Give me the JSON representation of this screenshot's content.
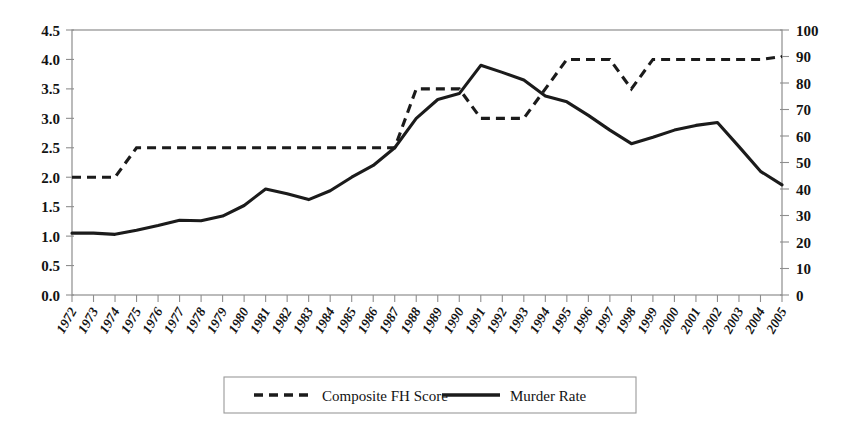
{
  "chart_data": {
    "type": "line",
    "title": "",
    "subtitle": "",
    "xlabel": "",
    "ylabel": "",
    "y2label": "",
    "grid": false,
    "legend_position": "bottom",
    "categories": [
      "1972",
      "1973",
      "1974",
      "1975",
      "1976",
      "1977",
      "1978",
      "1979",
      "1980",
      "1981",
      "1982",
      "1983",
      "1984",
      "1985",
      "1986",
      "1987",
      "1988",
      "1989",
      "1990",
      "1991",
      "1992",
      "1993",
      "1994",
      "1995",
      "1996",
      "1997",
      "1998",
      "1999",
      "2000",
      "2001",
      "2002",
      "2003",
      "2004",
      "2005"
    ],
    "ylim": [
      0,
      4.5
    ],
    "ytick_labels": [
      "0.0",
      "0.5",
      "1.0",
      "1.5",
      "2.0",
      "2.5",
      "3.0",
      "3.5",
      "4.0",
      "4.5"
    ],
    "ytick_values": [
      0,
      0.5,
      1.0,
      1.5,
      2.0,
      2.5,
      3.0,
      3.5,
      4.0,
      4.5
    ],
    "y2lim": [
      0,
      100
    ],
    "y2tick_labels": [
      "0",
      "10",
      "20",
      "30",
      "40",
      "50",
      "60",
      "70",
      "80",
      "90",
      "100"
    ],
    "y2tick_values": [
      0,
      10,
      20,
      30,
      40,
      50,
      60,
      70,
      80,
      90,
      100
    ],
    "series": [
      {
        "name": "Composite FH Score",
        "style": "dashed",
        "axis": "left",
        "color": "#1b1b1b",
        "values": [
          2.0,
          2.0,
          2.0,
          2.5,
          2.5,
          2.5,
          2.5,
          2.5,
          2.5,
          2.5,
          2.5,
          2.5,
          2.5,
          2.5,
          2.5,
          2.5,
          3.5,
          3.5,
          3.5,
          3.0,
          3.0,
          3.0,
          3.5,
          4.0,
          4.0,
          4.0,
          3.5,
          4.0,
          4.0,
          4.0,
          4.0,
          4.0,
          4.0,
          4.05
        ]
      },
      {
        "name": "Murder Rate",
        "style": "solid",
        "axis": "right",
        "color": "#1b1b1b",
        "values": [
          1.05,
          1.05,
          1.03,
          1.1,
          1.18,
          1.27,
          1.26,
          1.34,
          1.52,
          1.8,
          1.72,
          1.62,
          1.77,
          2.0,
          2.2,
          2.5,
          3.0,
          3.32,
          3.42,
          3.9,
          3.78,
          3.65,
          3.38,
          3.28,
          3.05,
          2.8,
          2.57,
          2.68,
          2.8,
          2.88,
          2.93,
          2.52,
          2.1,
          1.87
        ]
      }
    ],
    "series_right_axis_values": [
      23.3,
      23.3,
      22.9,
      24.4,
      26.2,
      28.2,
      28.0,
      29.8,
      33.8,
      40.0,
      38.2,
      36.0,
      39.3,
      44.4,
      48.9,
      55.6,
      66.7,
      73.8,
      76.0,
      86.7,
      84.0,
      81.1,
      75.1,
      72.9,
      67.8,
      62.2,
      57.1,
      59.6,
      62.2,
      64.0,
      65.1,
      56.0,
      46.7,
      41.6
    ]
  },
  "legend": {
    "items": [
      {
        "label": "Composite FH Score",
        "style": "dashed"
      },
      {
        "label": "Murder Rate",
        "style": "solid"
      }
    ]
  }
}
